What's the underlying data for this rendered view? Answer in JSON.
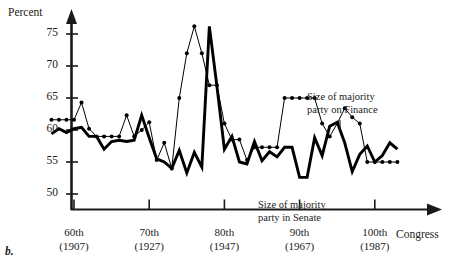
{
  "panel": {
    "label": "b."
  },
  "chart_data": {
    "type": "line",
    "title": "",
    "subtitle": "",
    "xlabel": "Congress",
    "ylabel": "Percent",
    "grid": false,
    "legend_position": "inline-annotations",
    "xlim": [
      57,
      103
    ],
    "ylim": [
      47.5,
      77.5
    ],
    "yticks": [
      50,
      55,
      60,
      65,
      70,
      75
    ],
    "ytick_labels": [
      "50",
      "55",
      "60",
      "65",
      "70",
      "75"
    ],
    "xticks": [
      60,
      70,
      80,
      90,
      100
    ],
    "xtick_labels": [
      "60th",
      "70th",
      "80th",
      "90th",
      "100th"
    ],
    "xtick_sublabels": [
      "(1907)",
      "(1927)",
      "(1947)",
      "(1967)",
      "(1987)"
    ],
    "x": [
      57,
      58,
      59,
      60,
      61,
      62,
      63,
      64,
      65,
      66,
      67,
      68,
      69,
      70,
      71,
      72,
      73,
      74,
      75,
      76,
      77,
      78,
      79,
      80,
      81,
      82,
      83,
      84,
      85,
      86,
      87,
      88,
      89,
      90,
      91,
      92,
      93,
      94,
      95,
      96,
      97,
      98,
      99,
      100,
      101,
      102,
      103
    ],
    "series": [
      {
        "name": "Size of majority party on Finance",
        "style": "thin-with-markers",
        "markers": true,
        "color": "#000000",
        "values": [
          61.6,
          61.6,
          61.6,
          61.6,
          64.3,
          60.2,
          59.0,
          59.0,
          59.0,
          59.0,
          62.3,
          59.0,
          60.0,
          61.2,
          55.3,
          58.0,
          54.0,
          65.0,
          72.0,
          76.2,
          72.0,
          67.0,
          67.0,
          61.0,
          58.5,
          58.5,
          55.3,
          57.3,
          57.3,
          57.3,
          57.3,
          65.0,
          65.0,
          65.0,
          65.0,
          65.0,
          61.0,
          59.0,
          61.0,
          63.4,
          62.0,
          61.0,
          55.0,
          55.0,
          55.0,
          55.0,
          55.0
        ]
      },
      {
        "name": "Size of majority party in Senate",
        "style": "thick-no-markers",
        "markers": false,
        "color": "#000000",
        "values": [
          59.4,
          60.2,
          59.6,
          60.2,
          60.4,
          59.0,
          59.0,
          57.0,
          58.2,
          58.4,
          58.2,
          58.4,
          62.3,
          58.8,
          55.5,
          55.0,
          54.0,
          56.8,
          53.3,
          56.5,
          54.2,
          76.2,
          66.9,
          57.0,
          59.0,
          55.0,
          54.7,
          58.2,
          55.2,
          56.6,
          55.8,
          57.3,
          57.3,
          52.6,
          52.6,
          58.8,
          56.0,
          60.6,
          61.2,
          58.0,
          53.5,
          56.2,
          57.5,
          55.0,
          56.0,
          58.0,
          57.0
        ]
      }
    ],
    "annotations": [
      {
        "id": "finance-label",
        "text_line1": "Size of majority",
        "text_line2": "party on Finance"
      },
      {
        "id": "senate-label",
        "text_line1": "Size of majority",
        "text_line2": "party in Senate"
      }
    ]
  }
}
